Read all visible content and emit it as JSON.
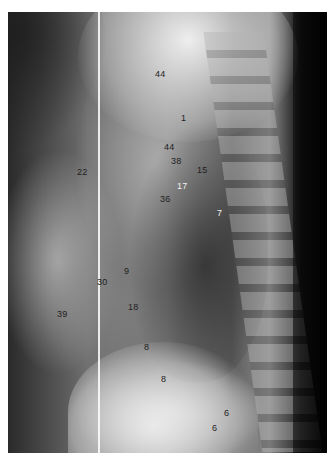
{
  "image": {
    "description": "Lateral chest radiograph with numbered anatomical labels",
    "labels": [
      {
        "text": "44",
        "x": 155,
        "y": 70,
        "tone": "dark"
      },
      {
        "text": "1",
        "x": 181,
        "y": 114,
        "tone": "dark"
      },
      {
        "text": "44",
        "x": 164,
        "y": 143,
        "tone": "dark"
      },
      {
        "text": "38",
        "x": 171,
        "y": 157,
        "tone": "dark"
      },
      {
        "text": "15",
        "x": 197,
        "y": 166,
        "tone": "dark"
      },
      {
        "text": "17",
        "x": 177,
        "y": 182,
        "tone": "light"
      },
      {
        "text": "22",
        "x": 77,
        "y": 168,
        "tone": "dark"
      },
      {
        "text": "36",
        "x": 160,
        "y": 195,
        "tone": "dark"
      },
      {
        "text": "7",
        "x": 217,
        "y": 209,
        "tone": "light"
      },
      {
        "text": "9",
        "x": 124,
        "y": 267,
        "tone": "dark"
      },
      {
        "text": "30",
        "x": 97,
        "y": 278,
        "tone": "dark"
      },
      {
        "text": "18",
        "x": 128,
        "y": 303,
        "tone": "dark"
      },
      {
        "text": "39",
        "x": 57,
        "y": 310,
        "tone": "dark"
      },
      {
        "text": "8",
        "x": 144,
        "y": 343,
        "tone": "dark"
      },
      {
        "text": "8",
        "x": 161,
        "y": 375,
        "tone": "dark"
      },
      {
        "text": "6",
        "x": 224,
        "y": 409,
        "tone": "dark"
      },
      {
        "text": "6",
        "x": 212,
        "y": 424,
        "tone": "dark"
      }
    ]
  }
}
